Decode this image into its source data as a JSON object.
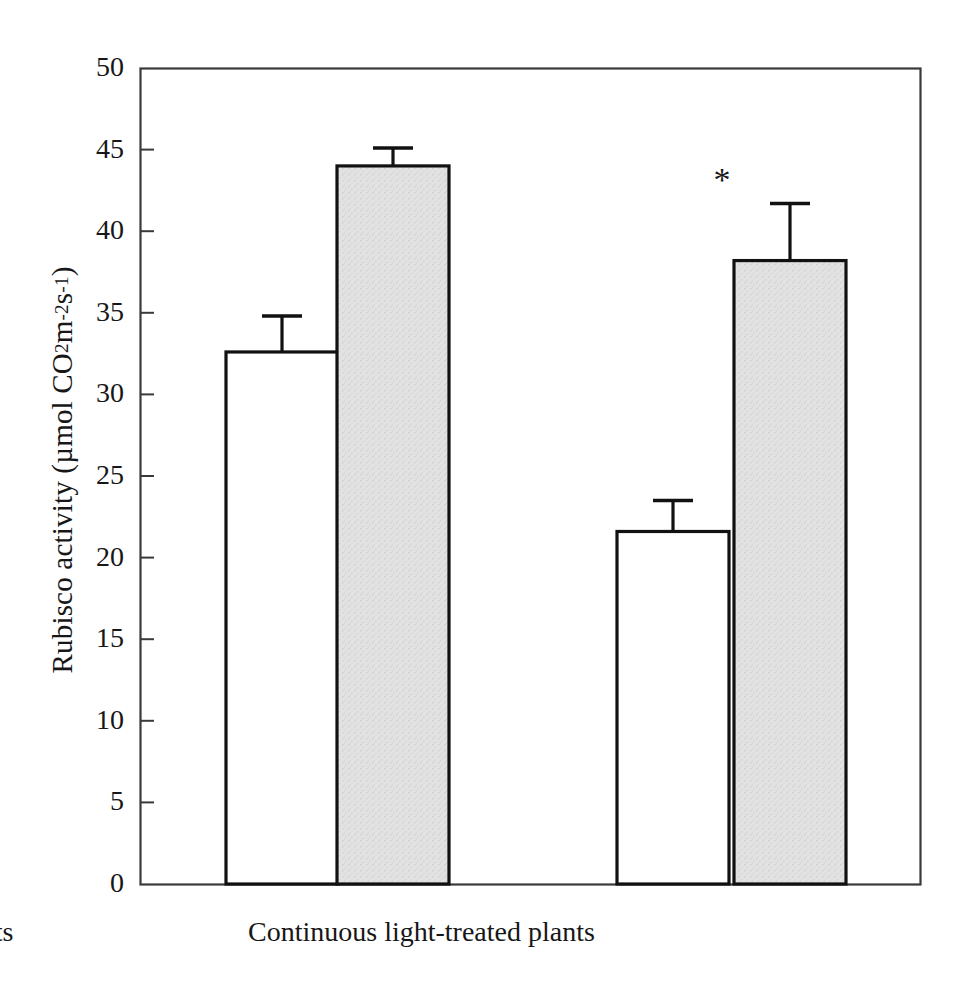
{
  "chart_data": {
    "type": "bar",
    "title": "",
    "subtitle": "",
    "xlabel": "",
    "ylabel": "Rubisco activity (µmol CO2 m-2 s-1)",
    "ylabel_parts": {
      "prefix": "Rubisco activity (µmol CO",
      "sub1": "2",
      "mid": " m",
      "sup1": "-2",
      "mid2": " s",
      "sup2": "-1",
      "suffix": ")"
    },
    "categories": [
      "Control plants",
      "Continuous light-treated plants"
    ],
    "series": [
      {
        "name": "open-bar",
        "fill": "#ffffff",
        "values": [
          32.6,
          21.6
        ],
        "errors": [
          2.2,
          1.9
        ]
      },
      {
        "name": "shaded-bar",
        "fill": "#e2e2e2",
        "values": [
          44.0,
          38.2
        ],
        "errors": [
          1.1,
          3.5
        ]
      }
    ],
    "ylim": [
      0,
      50
    ],
    "ytick_values": [
      0,
      5,
      10,
      15,
      20,
      25,
      30,
      35,
      40,
      45,
      50
    ],
    "ytick_labels": [
      "0",
      "5",
      "10",
      "15",
      "20",
      "25",
      "30",
      "35",
      "40",
      "45",
      "50"
    ],
    "grid": false,
    "legend": "none",
    "annotations": [
      {
        "text": "*",
        "name": "significance-asterisk",
        "x_px": 722,
        "y_px": 183,
        "note": "significance marker above shaded bar of continuous light-treated plants"
      }
    ],
    "frame": {
      "left_px": 140,
      "right_px": 920,
      "top_px": 68,
      "bottom_px": 884,
      "color": "#3a3a3a"
    },
    "bar_geometry": [
      {
        "name": "control-open-bar",
        "x_px": 225,
        "width_px": 112,
        "value": 32.6,
        "error": 2.2,
        "fill": "#ffffff"
      },
      {
        "name": "control-shaded-bar",
        "x_px": 336,
        "width_px": 112,
        "value": 44.0,
        "error": 1.1,
        "fill": "#e2e2e2"
      },
      {
        "name": "cl-open-bar",
        "x_px": 616,
        "width_px": 112,
        "value": 21.6,
        "error": 1.9,
        "fill": "#ffffff"
      },
      {
        "name": "cl-shaded-bar",
        "x_px": 733,
        "width_px": 112,
        "value": 38.2,
        "error": 3.5,
        "fill": "#e2e2e2"
      }
    ],
    "colors": {
      "axis": "#3a3a3a",
      "bar_outline": "#111111",
      "shaded_fill": "#e2e2e2",
      "open_fill": "#ffffff",
      "text": "#171717"
    }
  }
}
